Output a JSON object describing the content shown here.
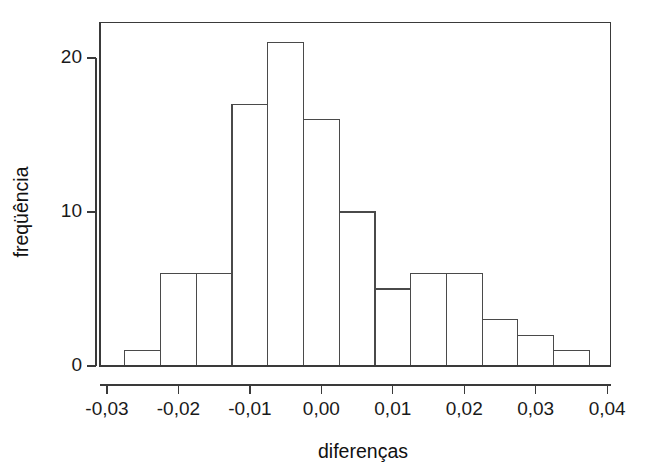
{
  "chart_data": {
    "type": "bar",
    "chart_subtype": "histogram",
    "title": "",
    "subtitle": "",
    "xlabel": "diferenças",
    "ylabel": "freqüência",
    "xlim": [
      -0.031,
      0.0405
    ],
    "ylim": [
      0,
      22.3
    ],
    "grid": false,
    "legend": null,
    "bin_width": 0.005,
    "bin_edges": [
      -0.0275,
      -0.0225,
      -0.0175,
      -0.0125,
      -0.0075,
      -0.0025,
      0.0025,
      0.0075,
      0.0125,
      0.0175,
      0.0225,
      0.0275,
      0.0325,
      0.0375
    ],
    "categories": [
      "-0.0275 a -0.0225",
      "-0.0225 a -0.0175",
      "-0.0175 a -0.0125",
      "-0.0125 a -0.0075",
      "-0.0075 a -0.0025",
      "-0.0025 a 0.0025",
      "0.0025 a 0.0075",
      "0.0075 a 0.0125",
      "0.0125 a 0.0175",
      "0.0175 a 0.0225",
      "0.0225 a 0.0275",
      "0.0275 a 0.0325",
      "0.0325 a 0.0375"
    ],
    "values": [
      1,
      6,
      6,
      17,
      21,
      16,
      10,
      5,
      6,
      6,
      3,
      2,
      1
    ],
    "total_count": 100,
    "x_ticks": [
      -0.03,
      -0.02,
      -0.01,
      0.0,
      0.01,
      0.02,
      0.03,
      0.04
    ],
    "x_tick_labels": [
      "-0,03",
      "-0,02",
      "-0,01",
      "0,00",
      "0,01",
      "0,02",
      "0,03",
      "0,04"
    ],
    "y_ticks": [
      0,
      10,
      20
    ],
    "y_tick_labels": [
      "0",
      "10",
      "20"
    ],
    "colors": {
      "bar_fill": "#ffffff",
      "bar_stroke": "#4a4a4a",
      "axis": "#3a3a3a",
      "text": "#1a1a1a",
      "background": "#ffffff"
    }
  }
}
